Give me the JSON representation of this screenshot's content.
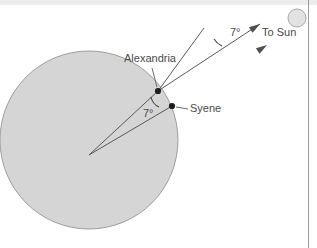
{
  "figure": {
    "background_color": "#ffffff",
    "earth": {
      "name": "Earth",
      "fill_color": "#d5d5d5",
      "stroke_color": "#9e9e9e",
      "center_x": 89,
      "center_y": 140,
      "radius": 89
    },
    "sun": {
      "label": "To Sun",
      "fill_color": "#e2e2e2",
      "stroke_color": "#a8a8a8",
      "center_x": 297,
      "center_y": 18,
      "radius": 9
    },
    "cities": [
      {
        "label": "Alexandria",
        "dot_x": 158,
        "dot_y": 91,
        "label_x": 124,
        "label_y": 62,
        "leader_from_x": 152,
        "leader_from_y": 68,
        "leader_to_x": 157,
        "leader_to_y": 87
      },
      {
        "label": "Syene",
        "dot_x": 172,
        "dot_y": 106,
        "label_x": 190,
        "label_y": 112,
        "leader_from_x": 176,
        "leader_from_y": 107,
        "leader_to_x": 188,
        "leader_to_y": 109
      }
    ],
    "angles": [
      {
        "id": "sun-ray-angle",
        "label": "7°",
        "label_x": 230,
        "label_y": 36,
        "value_degrees": 7
      },
      {
        "id": "earth-center-angle",
        "label": "7°",
        "label_x": 143,
        "label_y": 117,
        "value_degrees": 7
      }
    ],
    "rays": [
      {
        "name": "sun-ray-to-alexandria",
        "x1": 158,
        "y1": 91,
        "x2": 260,
        "y2": 24
      },
      {
        "name": "sun-ray-to-syene",
        "x1": 172,
        "y1": 106,
        "x2": 267,
        "y2": 45
      },
      {
        "name": "angle-reference-line",
        "x1": 204,
        "y1": 28,
        "x2": 158,
        "y2": 91
      }
    ],
    "radii": [
      {
        "name": "radius-to-alexandria",
        "x1": 89,
        "y1": 155,
        "x2": 158,
        "y2": 91
      },
      {
        "name": "radius-to-syene",
        "x1": 89,
        "y1": 155,
        "x2": 172,
        "y2": 106
      },
      {
        "name": "radius-extension-to-sun",
        "x1": 89,
        "y1": 155,
        "x2": 267,
        "y2": 45
      }
    ],
    "arrow_heads": [
      {
        "name": "arrow-alexandria-ray",
        "x": 260,
        "y": 24,
        "angle": -33
      },
      {
        "name": "arrow-syene-ray",
        "x": 267,
        "y": 45,
        "angle": -33
      }
    ]
  }
}
